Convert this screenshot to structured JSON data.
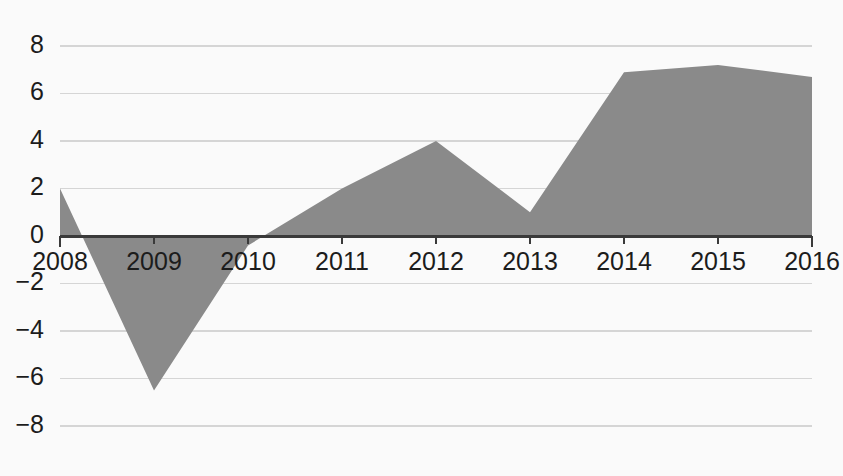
{
  "chart_data": {
    "type": "area",
    "title": "",
    "subtitle": "",
    "xlabel": "",
    "ylabel": "",
    "categories": [
      "2008",
      "2009",
      "2010",
      "2011",
      "2012",
      "2013",
      "2014",
      "2015",
      "2016"
    ],
    "x": [
      2008,
      2009,
      2010,
      2011,
      2012,
      2013,
      2014,
      2015,
      2016
    ],
    "values": [
      2.0,
      -6.5,
      -0.4,
      2.0,
      4.0,
      1.0,
      6.9,
      7.2,
      6.7
    ],
    "series": [
      {
        "name": "",
        "values": [
          2.0,
          -6.5,
          -0.4,
          2.0,
          4.0,
          1.0,
          6.9,
          7.2,
          6.7
        ]
      }
    ],
    "ylim": [
      -8,
      8
    ],
    "xlim": [
      2008,
      2016
    ],
    "yticks": [
      8,
      6,
      4,
      2,
      0,
      -2,
      -4,
      -6,
      -8
    ],
    "ytick_labels": [
      "8",
      "6",
      "4",
      "2",
      "0",
      "−2",
      "−4",
      "−6",
      "−8"
    ],
    "xticks": [
      2008,
      2009,
      2010,
      2011,
      2012,
      2013,
      2014,
      2015,
      2016
    ],
    "xtick_labels": [
      "2008",
      "2009",
      "2010",
      "2011",
      "2012",
      "2013",
      "2014",
      "2015",
      "2016"
    ],
    "grid": true,
    "grid_axis": "y",
    "legend": false,
    "legend_position": "none",
    "annotations": [],
    "colors": {
      "area_fill": "#8a8a8a",
      "gridline": "#d5d5d5",
      "axis_line": "#3a3a3a",
      "tick_label": "#1c1c1c",
      "background": "#fafafa"
    }
  },
  "geometry": {
    "plot_left": 60,
    "plot_right": 812,
    "y_zero": 236,
    "px_per_unit": 23.75,
    "x_label_y": 252,
    "ytick_label_x": 44
  }
}
